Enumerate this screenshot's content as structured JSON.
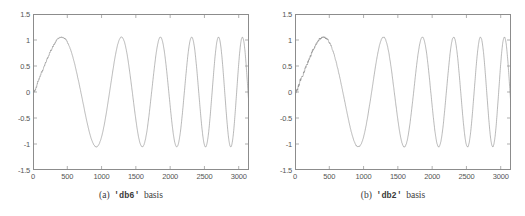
{
  "figure": {
    "panels": [
      {
        "id": "panel-a",
        "caption_label": "(a)",
        "caption_basis": "'db6'",
        "caption_word": "basis",
        "chart_ref": 0
      },
      {
        "id": "panel-b",
        "caption_label": "(b)",
        "caption_basis": "'db2'",
        "caption_word": "basis",
        "chart_ref": 1
      }
    ],
    "line_color": "#8a8a8a",
    "frame_color": "#8c8c8c",
    "tick_color": "#555555"
  },
  "chart_data": [
    {
      "type": "line",
      "title": "(a) 'db6' basis",
      "xlabel": "",
      "ylabel": "",
      "xlim": [
        0,
        3150
      ],
      "ylim": [
        -1.5,
        1.5
      ],
      "grid": false,
      "legend": null,
      "xticks": [
        0,
        500,
        1000,
        1500,
        2000,
        2500,
        3000
      ],
      "xticklabels": [
        "0",
        "500",
        "1000",
        "1500",
        "2000",
        "2500",
        "3000"
      ],
      "yticks": [
        -1.5,
        -1,
        -0.5,
        0,
        0.5,
        1,
        1.5
      ],
      "yticklabels": [
        "-1.5",
        "-1",
        "-0.5",
        "0",
        "0.5",
        "1",
        "1.5"
      ],
      "series": [
        {
          "name": "db6 reconstruction",
          "description": "Denoised chirp signal: amplitude ~1, instantaneous frequency increasing with x; residual noise visible near x<650",
          "noise_amplitude": 0.035,
          "chirp": {
            "amplitude": 1.0,
            "phase_start": 0.0,
            "freq_start_cycles_per_sample": 0.00042,
            "freq_end_cycles_per_sample": 0.0031
          },
          "peaks_x": [
            620,
            1400,
            1870,
            2260,
            2590,
            2880,
            3140
          ],
          "peaks_y": [
            1.06,
            1.04,
            1.02,
            1.06,
            1.05,
            1.1,
            1.05
          ],
          "troughs_x": [
            1100,
            1660,
            2080,
            2430,
            2740,
            3020
          ],
          "troughs_y": [
            -1.02,
            -0.99,
            -0.99,
            -1.0,
            -1.0,
            -0.95
          ]
        }
      ]
    },
    {
      "type": "line",
      "title": "(b) 'db2' basis",
      "xlabel": "",
      "ylabel": "",
      "xlim": [
        0,
        3150
      ],
      "ylim": [
        -1.5,
        1.5
      ],
      "grid": false,
      "legend": null,
      "xticks": [
        0,
        500,
        1000,
        1500,
        2000,
        2500,
        3000
      ],
      "xticklabels": [
        "0",
        "500",
        "1000",
        "1500",
        "2000",
        "2500",
        "3000"
      ],
      "yticks": [
        -1.5,
        -1,
        -0.5,
        0,
        0.5,
        1,
        1.5
      ],
      "yticklabels": [
        "-1.5",
        "-1",
        "-0.5",
        "0",
        "0.5",
        "1",
        "1.5"
      ],
      "series": [
        {
          "name": "db2 reconstruction",
          "description": "Denoised chirp signal with slightly more residual jitter than db6 across the whole record",
          "noise_amplitude": 0.05,
          "chirp": {
            "amplitude": 1.0,
            "phase_start": 0.0,
            "freq_start_cycles_per_sample": 0.00042,
            "freq_end_cycles_per_sample": 0.0031
          },
          "peaks_x": [
            630,
            1390,
            1860,
            2260,
            2590,
            2880,
            3140
          ],
          "peaks_y": [
            1.12,
            1.05,
            1.05,
            1.07,
            1.07,
            1.11,
            1.08
          ],
          "troughs_x": [
            1100,
            1660,
            2080,
            2430,
            2740,
            3020
          ],
          "troughs_y": [
            -1.03,
            -1.0,
            -1.0,
            -1.05,
            -1.0,
            -0.97
          ]
        }
      ]
    }
  ]
}
